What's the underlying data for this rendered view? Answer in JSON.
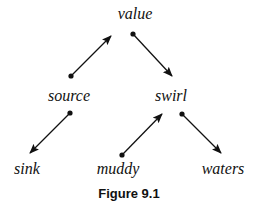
{
  "diagram": {
    "caption": "Figure 9.1",
    "nodes": [
      {
        "id": "value",
        "label": "value",
        "x": 135,
        "y": 5
      },
      {
        "id": "source",
        "label": "source",
        "x": 69,
        "y": 87
      },
      {
        "id": "swirl",
        "label": "swirl",
        "x": 171,
        "y": 87
      },
      {
        "id": "sink",
        "label": "sink",
        "x": 27,
        "y": 160
      },
      {
        "id": "muddy",
        "label": "muddy",
        "x": 118,
        "y": 160
      },
      {
        "id": "waters",
        "label": "waters",
        "x": 223,
        "y": 160
      }
    ],
    "edges": [
      {
        "from": "source",
        "to": "value",
        "x1": 71,
        "y1": 76,
        "x2": 111,
        "y2": 36
      },
      {
        "from": "value",
        "to": "swirl",
        "x1": 133,
        "y1": 34,
        "x2": 172,
        "y2": 76
      },
      {
        "from": "source",
        "to": "sink",
        "x1": 70,
        "y1": 113,
        "x2": 30,
        "y2": 153
      },
      {
        "from": "muddy",
        "to": "swirl",
        "x1": 122,
        "y1": 155,
        "x2": 162,
        "y2": 114
      },
      {
        "from": "swirl",
        "to": "waters",
        "x1": 182,
        "y1": 114,
        "x2": 221,
        "y2": 153
      }
    ],
    "colors": {
      "stroke": "#111111",
      "background": "#ffffff"
    }
  }
}
